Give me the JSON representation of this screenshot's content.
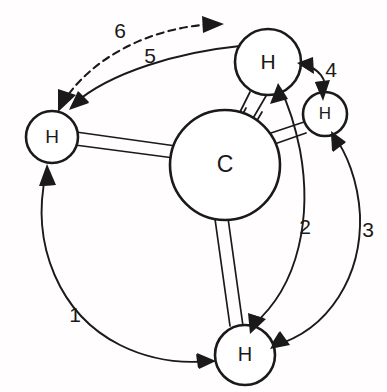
{
  "figure": {
    "name": "methane-permutation-diagram",
    "background_color": "#fffdfd",
    "ink_color": "#1a1a1a"
  },
  "atoms": [
    {
      "id": "carbon-center",
      "label": "C",
      "cx": 225,
      "cy": 165,
      "r": 55,
      "stroke_width": 2.6,
      "font_size": 23
    },
    {
      "id": "hydrogen-top",
      "label": "H",
      "cx": 268,
      "cy": 62,
      "r": 33,
      "stroke_width": 2.6,
      "font_size": 21
    },
    {
      "id": "hydrogen-left",
      "label": "H",
      "cx": 52,
      "cy": 137,
      "r": 26,
      "stroke_width": 2.6,
      "font_size": 19
    },
    {
      "id": "hydrogen-right",
      "label": "H",
      "cx": 325,
      "cy": 114,
      "r": 22,
      "stroke_width": 2.6,
      "font_size": 17
    },
    {
      "id": "hydrogen-bottom",
      "label": "H",
      "cx": 245,
      "cy": 355,
      "r": 30,
      "stroke_width": 2.6,
      "font_size": 20
    }
  ],
  "bonds": [
    {
      "id": "bond-c-left",
      "from": "carbon-center",
      "to": "hydrogen-left",
      "style": "double-line",
      "stroke_width": 1.7
    },
    {
      "id": "bond-c-top",
      "from": "carbon-center",
      "to": "hydrogen-top",
      "style": "double-line-broken",
      "stroke_width": 1.7
    },
    {
      "id": "bond-c-right",
      "from": "carbon-center",
      "to": "hydrogen-right",
      "style": "double-line",
      "stroke_width": 1.7
    },
    {
      "id": "bond-c-bottom",
      "from": "carbon-center",
      "to": "hydrogen-bottom",
      "style": "double-line",
      "stroke_width": 1.7
    }
  ],
  "arrows": [
    {
      "id": "arrow-1",
      "number": "1",
      "label_x": 75,
      "label_y": 316,
      "from": "hydrogen-left",
      "to": "hydrogen-bottom",
      "dashed": false,
      "stroke_width": 1.9
    },
    {
      "id": "arrow-2",
      "number": "2",
      "label_x": 305,
      "label_y": 228,
      "from": "hydrogen-bottom",
      "to": "hydrogen-top",
      "dashed": false,
      "stroke_width": 1.9
    },
    {
      "id": "arrow-3",
      "number": "3",
      "label_x": 368,
      "label_y": 231,
      "from": "hydrogen-bottom",
      "to": "hydrogen-right",
      "dashed": false,
      "stroke_width": 1.9
    },
    {
      "id": "arrow-4",
      "number": "4",
      "label_x": 331,
      "label_y": 71,
      "from": "hydrogen-right",
      "to": "hydrogen-top",
      "dashed": false,
      "stroke_width": 1.9
    },
    {
      "id": "arrow-5",
      "number": "5",
      "label_x": 150,
      "label_y": 57,
      "from": "hydrogen-top",
      "to": "hydrogen-left",
      "dashed": false,
      "stroke_width": 1.9
    },
    {
      "id": "arrow-6",
      "number": "6",
      "label_x": 120,
      "label_y": 32,
      "from": "hydrogen-left",
      "to": "hydrogen-top",
      "dashed": true,
      "stroke_width": 2.1
    }
  ]
}
